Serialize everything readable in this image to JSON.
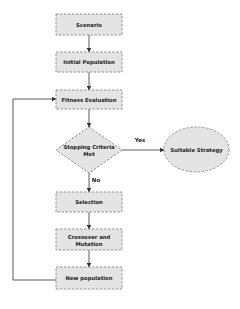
{
  "diagram": {
    "colors": {
      "node_fill": "#e4e4e4",
      "node_stroke": "#8a8a8a",
      "edge": "#333333",
      "text": "#222222"
    },
    "nodes": [
      {
        "id": "scenario",
        "shape": "rect",
        "label": "Scenario"
      },
      {
        "id": "initial_population",
        "shape": "rect",
        "label": "Initial Population"
      },
      {
        "id": "fitness_evaluation",
        "shape": "rect",
        "label": "Fitness Evaluation"
      },
      {
        "id": "stopping_criteria",
        "shape": "diamond",
        "label_line1": "Stopping Criteria",
        "label_line2": "Met"
      },
      {
        "id": "suitable_strategy",
        "shape": "ellipse",
        "label": "Suitable Strategy"
      },
      {
        "id": "selection",
        "shape": "rect",
        "label": "Selection"
      },
      {
        "id": "crossover_mutation",
        "shape": "rect",
        "label_line1": "Crossover and",
        "label_line2": "Mutation"
      },
      {
        "id": "new_population",
        "shape": "rect",
        "label": "New population"
      }
    ],
    "edges": [
      {
        "from": "scenario",
        "to": "initial_population",
        "label": ""
      },
      {
        "from": "initial_population",
        "to": "fitness_evaluation",
        "label": ""
      },
      {
        "from": "fitness_evaluation",
        "to": "stopping_criteria",
        "label": ""
      },
      {
        "from": "stopping_criteria",
        "to": "suitable_strategy",
        "label": "Yes"
      },
      {
        "from": "stopping_criteria",
        "to": "selection",
        "label": "No"
      },
      {
        "from": "selection",
        "to": "crossover_mutation",
        "label": ""
      },
      {
        "from": "crossover_mutation",
        "to": "new_population",
        "label": ""
      },
      {
        "from": "new_population",
        "to": "fitness_evaluation",
        "label": ""
      }
    ]
  }
}
